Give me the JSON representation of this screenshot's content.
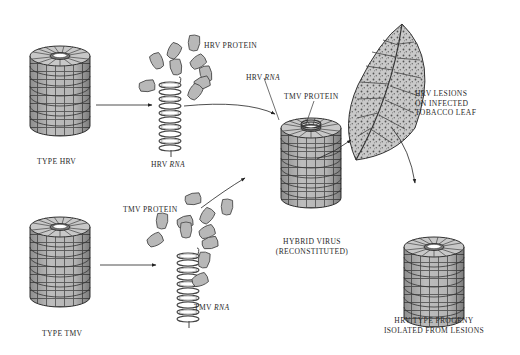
{
  "diagram": {
    "nodes": [
      {
        "id": "type-hrv",
        "label": "TYPE HRV"
      },
      {
        "id": "hrv-protein",
        "label": "HRV PROTEIN"
      },
      {
        "id": "hrv-rna",
        "label_prefix": "HRV",
        "label_italic": "RNA"
      },
      {
        "id": "type-tmv",
        "label": "TYPE TMV"
      },
      {
        "id": "tmv-protein",
        "label": "TMV PROTEIN"
      },
      {
        "id": "tmv-rna",
        "label_prefix": "TMV",
        "label_italic": "RNA"
      },
      {
        "id": "hybrid-virus",
        "label_line1": "HYBRID VIRUS",
        "label_line2": "(RECONSTITUTED)",
        "callouts": [
          {
            "label_prefix": "HRV",
            "label_italic": "RNA"
          },
          {
            "label": "TMV PROTEIN"
          }
        ]
      },
      {
        "id": "infected-leaf",
        "label_lines": [
          "HRV LESIONS",
          "ON INFECTED",
          "TOBACCO LEAF"
        ]
      },
      {
        "id": "progeny",
        "label_line1": "HRV TYPE PROGENY",
        "label_line2": "ISOLATED FROM LESIONS"
      }
    ],
    "edges": [
      {
        "from": "type-hrv",
        "to": "hrv-rna"
      },
      {
        "from": "type-tmv",
        "to": "tmv-rna"
      },
      {
        "from": "hrv-rna",
        "to": "hybrid-virus"
      },
      {
        "from": "tmv-protein",
        "to": "hybrid-virus"
      },
      {
        "from": "hybrid-virus",
        "to": "infected-leaf"
      },
      {
        "from": "infected-leaf",
        "to": "progeny"
      }
    ],
    "colors": {
      "protein_fill": "#b8b8b8",
      "outline": "#3a3a3a",
      "leaf_fill": "#c4c4c4",
      "text": "#2a2a2a"
    }
  }
}
